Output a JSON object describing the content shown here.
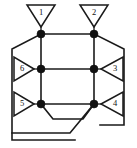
{
  "diagram": {
    "type": "node-edge-network",
    "stroke_color": "#1a1a1a",
    "node_color": "#111111",
    "background_color": "#ffffff",
    "nodes": [
      {
        "id": "n1",
        "name": "node-top-left",
        "x": 41,
        "y": 34
      },
      {
        "id": "n2",
        "name": "node-top-right",
        "x": 94,
        "y": 34
      },
      {
        "id": "n3",
        "name": "node-middle-left",
        "x": 41,
        "y": 69
      },
      {
        "id": "n4",
        "name": "node-middle-right",
        "x": 94,
        "y": 69
      },
      {
        "id": "n5",
        "name": "node-bottom-left",
        "x": 41,
        "y": 104
      },
      {
        "id": "n6",
        "name": "node-bottom-right",
        "x": 94,
        "y": 104
      }
    ],
    "terminals": [
      {
        "id": "t1",
        "label": "1",
        "name": "terminal-1",
        "orientation": "down",
        "cx": 41,
        "cy": 16,
        "attaches_to": "n1"
      },
      {
        "id": "t2",
        "label": "2",
        "name": "terminal-2",
        "orientation": "down",
        "cx": 94,
        "cy": 16,
        "attaches_to": "n2"
      },
      {
        "id": "t3",
        "label": "3",
        "name": "terminal-3",
        "orientation": "left",
        "cx": 112,
        "cy": 69,
        "attaches_to": "n4"
      },
      {
        "id": "t4",
        "label": "4",
        "name": "terminal-4",
        "orientation": "left",
        "cx": 112,
        "cy": 104,
        "attaches_to": "n6"
      },
      {
        "id": "t5",
        "label": "5",
        "name": "terminal-5",
        "orientation": "right",
        "cx": 23,
        "cy": 104,
        "attaches_to": "n5"
      },
      {
        "id": "t6",
        "label": "6",
        "name": "terminal-6",
        "orientation": "right",
        "cx": 23,
        "cy": 69,
        "attaches_to": "n3"
      }
    ],
    "edges": [
      {
        "name": "edge-top-horizontal",
        "path": "M41,34 L94,34"
      },
      {
        "name": "edge-middle-horizontal",
        "path": "M41,69 L94,69"
      },
      {
        "name": "edge-bottom-horizontal",
        "path": "M41,104 L94,104"
      },
      {
        "name": "edge-left-vertical",
        "path": "M41,34 L41,104"
      },
      {
        "name": "edge-right-vertical",
        "path": "M94,34 L94,104"
      },
      {
        "name": "edge-outer-left",
        "path": "M41,34 L12,49 L12,140 L75,140"
      },
      {
        "name": "edge-outer-right",
        "path": "M94,34 L124,49 L124,125 L100,125"
      },
      {
        "name": "edge-bottom-bypass",
        "path": "M41,104 L53,119 L83,119 L94,104"
      },
      {
        "name": "edge-bottom-cross",
        "path": "M94,104 L70,133 L12,133"
      }
    ]
  }
}
